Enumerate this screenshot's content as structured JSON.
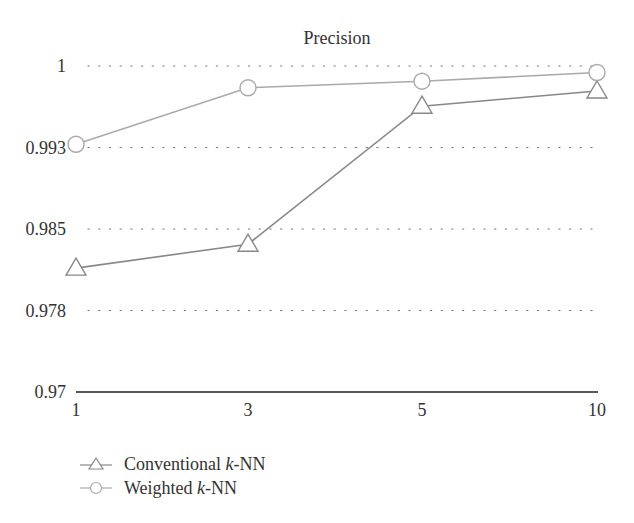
{
  "chart_data": {
    "type": "line",
    "title": "Precision",
    "xlabel": "",
    "ylabel": "",
    "x": [
      "1",
      "3",
      "5",
      "10"
    ],
    "ylim": [
      0.97,
      1.0
    ],
    "yticks": [
      "1",
      "0.993",
      "0.985",
      "0.978",
      "0.97"
    ],
    "ytick_values": [
      1.0,
      0.9925,
      0.985,
      0.9775,
      0.97
    ],
    "grid": "horizontal dotted",
    "legend_position": "bottom-left",
    "series": [
      {
        "name": "Conventional k-NN",
        "marker": "triangle",
        "color": "#888888",
        "values": [
          0.9814,
          0.9836,
          0.9963,
          0.9977
        ]
      },
      {
        "name": "Weighted k-NN",
        "marker": "circle",
        "color": "#aaaaaa",
        "values": [
          0.9928,
          0.998,
          0.9986,
          0.9994
        ]
      }
    ]
  },
  "legend": {
    "items": [
      {
        "prefix": "Conventional ",
        "italic": "k",
        "suffix": "-NN"
      },
      {
        "prefix": "Weighted ",
        "italic": "k",
        "suffix": "-NN"
      }
    ]
  }
}
